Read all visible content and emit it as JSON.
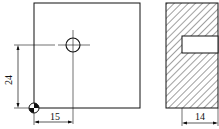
{
  "front_view": {
    "dim_vertical": "24",
    "dim_horizontal": "15"
  },
  "side_view": {
    "dim_horizontal": "14"
  },
  "colors": {
    "stroke": "#111111",
    "background": "#ffffff"
  }
}
